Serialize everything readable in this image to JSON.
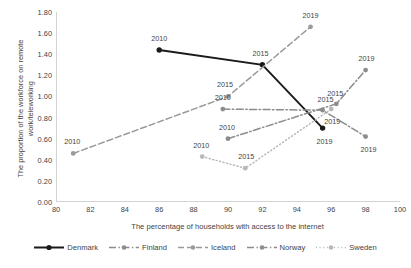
{
  "chart_data": {
    "type": "scatter",
    "title": "",
    "xlabel": "The percentage of households with access to the internet",
    "ylabel": "The proportion of the workforce on remote work/teleworking",
    "xlim": [
      80,
      100
    ],
    "ylim": [
      0.0,
      1.8
    ],
    "xticks": [
      "80",
      "82",
      "84",
      "86",
      "88",
      "90",
      "92",
      "94",
      "96",
      "98",
      "100"
    ],
    "yticks": [
      "0.00",
      "0.20",
      "0.40",
      "0.60",
      "0.80",
      "1.00",
      "1.20",
      "1.40",
      "1.60",
      "1.80"
    ],
    "grid": false,
    "legend_position": "bottom",
    "point_labels_shown": true,
    "series": [
      {
        "name": "Denmark",
        "color": "#1a1a1a",
        "dash": "solid",
        "points": [
          {
            "label": "2010",
            "x": 86.0,
            "y": 1.44,
            "label_dx": 0,
            "label_dy": -12
          },
          {
            "label": "2015",
            "x": 92.0,
            "y": 1.3,
            "label_dx": -2,
            "label_dy": -12
          },
          {
            "label": "2019",
            "x": 95.5,
            "y": 0.7,
            "label_dx": 2,
            "label_dy": 13
          }
        ]
      },
      {
        "name": "Finland",
        "color": "#8c8c8c",
        "dash": "dashdot",
        "points": [
          {
            "label": "2010",
            "x": 89.7,
            "y": 0.88,
            "label_dx": 0,
            "label_dy": -12
          },
          {
            "label": "2015",
            "x": 95.5,
            "y": 0.87,
            "label_dx": 3,
            "label_dy": -11
          },
          {
            "label": "2019",
            "x": 98.0,
            "y": 0.62,
            "label_dx": 3,
            "label_dy": 12
          }
        ]
      },
      {
        "name": "Iceland",
        "color": "#9a9a9a",
        "dash": "dashed",
        "points": [
          {
            "label": "2010",
            "x": 81.0,
            "y": 0.46,
            "label_dx": -1,
            "label_dy": -12
          },
          {
            "label": "2015",
            "x": 90.0,
            "y": 1.0,
            "label_dx": -3,
            "label_dy": -12
          },
          {
            "label": "2019",
            "x": 94.8,
            "y": 1.66,
            "label_dx": 0,
            "label_dy": -12
          }
        ]
      },
      {
        "name": "Norway",
        "color": "#8c8c8c",
        "dash": "dashdot",
        "points": [
          {
            "label": "2010",
            "x": 90.0,
            "y": 0.6,
            "label_dx": -1,
            "label_dy": -12
          },
          {
            "label": "2015",
            "x": 96.3,
            "y": 0.93,
            "label_dx": -1,
            "label_dy": -11
          },
          {
            "label": "2019",
            "x": 98.0,
            "y": 1.25,
            "label_dx": 1,
            "label_dy": -12
          }
        ]
      },
      {
        "name": "Sweden",
        "color": "#b8b8b8",
        "dash": "dotted",
        "points": [
          {
            "label": "2010",
            "x": 88.5,
            "y": 0.43,
            "label_dx": -1,
            "label_dy": -12
          },
          {
            "label": "2015",
            "x": 91.0,
            "y": 0.32,
            "label_dx": 1,
            "label_dy": -12
          },
          {
            "label": "2019",
            "x": 96.0,
            "y": 0.88,
            "label_dx": 1,
            "label_dy": 12
          }
        ]
      }
    ]
  },
  "legend": {
    "items": [
      {
        "label": "Denmark"
      },
      {
        "label": "Finland"
      },
      {
        "label": "Iceland"
      },
      {
        "label": "Norway"
      },
      {
        "label": "Sweden"
      }
    ]
  }
}
